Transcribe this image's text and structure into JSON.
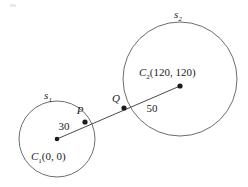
{
  "figure": {
    "background_color": "#ffffff",
    "circle_stroke_color": "#6d6d6d",
    "line_stroke_color": "#4a4a4a",
    "label_color": "#1b1b1b"
  },
  "circles": [
    {
      "name": "s1",
      "label": "s",
      "label_subscript": "1",
      "label_x": 48,
      "label_y": 99,
      "cx": 57,
      "cy": 139,
      "r": 38,
      "radius_value": "30",
      "radius_label_x": 64,
      "radius_label_y": 130,
      "center_label": "C",
      "center_subscript": "1",
      "center_coords": "(0, 0)",
      "center_label_x": 31,
      "center_label_y": 160
    },
    {
      "name": "s2",
      "label": "s",
      "label_subscript": "2",
      "label_x": 178,
      "label_y": 18,
      "cx": 180,
      "cy": 79,
      "r": 57,
      "radius_value": "50",
      "radius_label_x": 150,
      "radius_label_y": 110,
      "center_label": "C",
      "center_subscript": "2",
      "center_coords": "(120, 120)",
      "center_label_x": 139,
      "center_label_y": 76
    }
  ],
  "points": [
    {
      "name": "C1",
      "label": "",
      "x": 57,
      "y": 139
    },
    {
      "name": "P",
      "label": "P",
      "x": 85,
      "y": 122,
      "label_x": 80,
      "label_y": 114
    },
    {
      "name": "Q",
      "label": "Q",
      "x": 124,
      "y": 108,
      "label_x": 114,
      "label_y": 102
    },
    {
      "name": "C2",
      "label": "",
      "x": 180,
      "y": 86
    }
  ],
  "segment": {
    "name": "center-line",
    "x1": 57,
    "y1": 139,
    "x2": 180,
    "y2": 86
  },
  "artifact": {
    "name": "scan-artifact",
    "x": 10,
    "y": 4,
    "width": 6,
    "height": 3
  }
}
